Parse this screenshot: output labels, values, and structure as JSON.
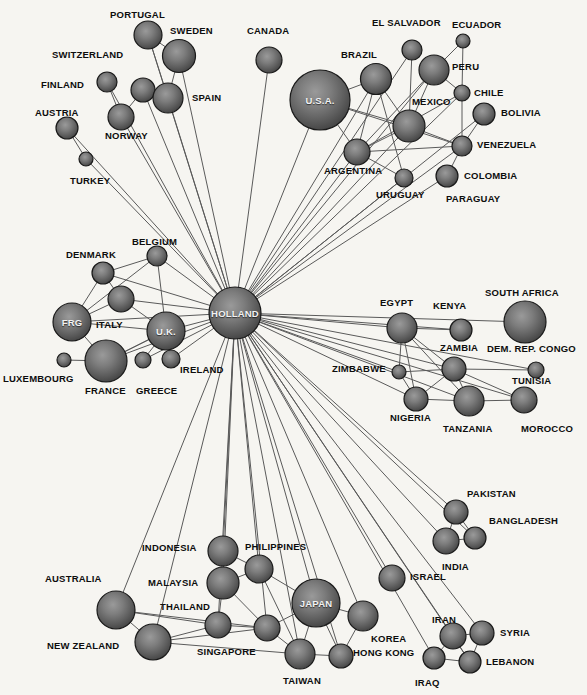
{
  "diagram": {
    "title": "HOLLAND",
    "background_color": "#f6f5f1",
    "edge_color": "#5a5a5a",
    "node_fill_center": "#8d8d8d",
    "node_fill_edge": "#4b4b4b",
    "node_stroke": "#1a1a1a",
    "label_color": "#0d0d0d",
    "inner_label_color": "#f2f2f2"
  },
  "chart_data": {
    "type": "network",
    "title": "HOLLAND",
    "hub": "HOLLAND",
    "node_count": 71,
    "nodes": [
      {
        "id": "PORTUGAL",
        "label": "PORTUGAL",
        "x": 148,
        "y": 35,
        "r": 14,
        "label_x": 110,
        "label_y": 10,
        "inside": false
      },
      {
        "id": "SWEDEN",
        "label": "SWEDEN",
        "x": 179,
        "y": 56,
        "r": 16.5,
        "label_x": 170,
        "label_y": 26,
        "inside": false
      },
      {
        "id": "CANADA",
        "label": "CANADA",
        "x": 269,
        "y": 60,
        "r": 13,
        "label_x": 247,
        "label_y": 26,
        "inside": false
      },
      {
        "id": "EL SALVADOR",
        "label": "EL SALVADOR",
        "x": 412,
        "y": 50,
        "r": 10,
        "label_x": 372,
        "label_y": 18,
        "inside": false
      },
      {
        "id": "ECUADOR",
        "label": "ECUADOR",
        "x": 463,
        "y": 41,
        "r": 7,
        "label_x": 452,
        "label_y": 20,
        "inside": false
      },
      {
        "id": "SWITZERLAND",
        "label": "SWITZERLAND",
        "x": 143,
        "y": 90,
        "r": 12,
        "label_x": 52,
        "label_y": 50,
        "inside": false
      },
      {
        "id": "BRAZIL",
        "label": "BRAZIL",
        "x": 376,
        "y": 79,
        "r": 15.5,
        "label_x": 341,
        "label_y": 50,
        "inside": false
      },
      {
        "id": "PERU",
        "label": "PERU",
        "x": 434,
        "y": 70,
        "r": 15,
        "label_x": 452,
        "label_y": 62,
        "inside": false
      },
      {
        "id": "FINLAND",
        "label": "FINLAND",
        "x": 107,
        "y": 82,
        "r": 10,
        "label_x": 41,
        "label_y": 80,
        "inside": false
      },
      {
        "id": "SPAIN",
        "label": "SPAIN",
        "x": 168,
        "y": 98,
        "r": 15,
        "label_x": 192,
        "label_y": 93,
        "inside": false
      },
      {
        "id": "U.S.A.",
        "label": "U.S.A.",
        "x": 320,
        "y": 100,
        "r": 30,
        "label_x": 0,
        "label_y": 0,
        "inside": true
      },
      {
        "id": "MEXICO",
        "label": "MEXICO",
        "x": 409,
        "y": 126,
        "r": 16,
        "label_x": 412,
        "label_y": 97,
        "inside": false
      },
      {
        "id": "CHILE",
        "label": "CHILE",
        "x": 462,
        "y": 93,
        "r": 8,
        "label_x": 474,
        "label_y": 88,
        "inside": false
      },
      {
        "id": "AUSTRIA",
        "label": "AUSTRIA",
        "x": 67,
        "y": 128,
        "r": 11,
        "label_x": 35,
        "label_y": 108,
        "inside": false
      },
      {
        "id": "NORWAY",
        "label": "NORWAY",
        "x": 121,
        "y": 117,
        "r": 13,
        "label_x": 105,
        "label_y": 131,
        "inside": false
      },
      {
        "id": "BOLIVIA",
        "label": "BOLIVIA",
        "x": 484,
        "y": 114,
        "r": 11,
        "label_x": 501,
        "label_y": 108,
        "inside": false
      },
      {
        "id": "VENEZUELA",
        "label": "VENEZUELA",
        "x": 462,
        "y": 146,
        "r": 10,
        "label_x": 477,
        "label_y": 140,
        "inside": false
      },
      {
        "id": "TURKEY",
        "label": "TURKEY",
        "x": 86,
        "y": 159,
        "r": 7,
        "label_x": 70,
        "label_y": 176,
        "inside": false
      },
      {
        "id": "ARGENTINA",
        "label": "ARGENTINA",
        "x": 357,
        "y": 152,
        "r": 13,
        "label_x": 324,
        "label_y": 166,
        "inside": false
      },
      {
        "id": "COLOMBIA",
        "label": "COLOMBIA",
        "x": 447,
        "y": 176,
        "r": 11,
        "label_x": 464,
        "label_y": 171,
        "inside": false
      },
      {
        "id": "URUGUAY",
        "label": "URUGUAY",
        "x": 404,
        "y": 178,
        "r": 9,
        "label_x": 376,
        "label_y": 190,
        "inside": false
      },
      {
        "id": "PARAGUAY",
        "label": "PARAGUAY",
        "x": 447,
        "y": 176,
        "r": 0,
        "label_x": 446,
        "label_y": 194,
        "inside": false
      },
      {
        "id": "DENMARK",
        "label": "DENMARK",
        "x": 103,
        "y": 273,
        "r": 11,
        "label_x": 66,
        "label_y": 250,
        "inside": false
      },
      {
        "id": "BELGIUM",
        "label": "BELGIUM",
        "x": 157,
        "y": 256,
        "r": 10,
        "label_x": 132,
        "label_y": 237,
        "inside": false
      },
      {
        "id": "SOUTH AFRICA",
        "label": "SOUTH AFRICA",
        "x": 525,
        "y": 322,
        "r": 21,
        "label_x": 485,
        "label_y": 288,
        "inside": false
      },
      {
        "id": "ITALY",
        "label": "ITALY",
        "x": 121,
        "y": 299,
        "r": 13,
        "label_x": 96,
        "label_y": 320,
        "inside": false
      },
      {
        "id": "EGYPT",
        "label": "EGYPT",
        "x": 402,
        "y": 328,
        "r": 15,
        "label_x": 380,
        "label_y": 298,
        "inside": false
      },
      {
        "id": "KENYA",
        "label": "KENYA",
        "x": 461,
        "y": 330,
        "r": 11,
        "label_x": 433,
        "label_y": 301,
        "inside": false
      },
      {
        "id": "FRG",
        "label": "FRG",
        "x": 72,
        "y": 322,
        "r": 19,
        "label_x": 0,
        "label_y": 0,
        "inside": true
      },
      {
        "id": "HOLLAND",
        "label": "HOLLAND",
        "x": 235,
        "y": 313,
        "r": 26,
        "label_x": 0,
        "label_y": 0,
        "inside": true
      },
      {
        "id": "U.K.",
        "label": "U.K.",
        "x": 166,
        "y": 331,
        "r": 19,
        "label_x": 0,
        "label_y": 0,
        "inside": true
      },
      {
        "id": "ZAMBIA",
        "label": "ZAMBIA",
        "x": 454,
        "y": 369,
        "r": 12,
        "label_x": 440,
        "label_y": 343,
        "inside": false
      },
      {
        "id": "DEM. REP. CONGO",
        "label": "DEM. REP. CONGO",
        "x": 536,
        "y": 370,
        "r": 8,
        "label_x": 487,
        "label_y": 344,
        "inside": false
      },
      {
        "id": "ZIMBABWE",
        "label": "ZIMBABWE",
        "x": 399,
        "y": 372,
        "r": 7,
        "label_x": 332,
        "label_y": 364,
        "inside": false
      },
      {
        "id": "LUXEMBOURG",
        "label": "LUXEMBOURG",
        "x": 64,
        "y": 360,
        "r": 7,
        "label_x": 3,
        "label_y": 374,
        "inside": false
      },
      {
        "id": "FRANCE",
        "label": "FRANCE",
        "x": 106,
        "y": 361,
        "r": 21,
        "label_x": 85,
        "label_y": 386,
        "inside": false
      },
      {
        "id": "GREECE",
        "label": "GREECE",
        "x": 143,
        "y": 360,
        "r": 8,
        "label_x": 136,
        "label_y": 386,
        "inside": false
      },
      {
        "id": "IRELAND",
        "label": "IRELAND",
        "x": 171,
        "y": 359,
        "r": 9,
        "label_x": 180,
        "label_y": 365,
        "inside": false
      },
      {
        "id": "TUNISIA",
        "label": "TUNISIA",
        "x": 524,
        "y": 400,
        "r": 13,
        "label_x": 512,
        "label_y": 376,
        "inside": false
      },
      {
        "id": "NIGERIA",
        "label": "NIGERIA",
        "x": 416,
        "y": 399,
        "r": 12,
        "label_x": 390,
        "label_y": 413,
        "inside": false
      },
      {
        "id": "TANZANIA",
        "label": "TANZANIA",
        "x": 469,
        "y": 401,
        "r": 15,
        "label_x": 443,
        "label_y": 424,
        "inside": false
      },
      {
        "id": "MOROCCO",
        "label": "MOROCCO",
        "x": 524,
        "y": 400,
        "r": 0,
        "label_x": 521,
        "label_y": 424,
        "inside": false
      },
      {
        "id": "PAKISTAN",
        "label": "PAKISTAN",
        "x": 456,
        "y": 512,
        "r": 12,
        "label_x": 467,
        "label_y": 489,
        "inside": false
      },
      {
        "id": "BANGLADESH",
        "label": "BANGLADESH",
        "x": 475,
        "y": 538,
        "r": 11,
        "label_x": 489,
        "label_y": 516,
        "inside": false
      },
      {
        "id": "INDONESIA",
        "label": "INDONESIA",
        "x": 223,
        "y": 551,
        "r": 15,
        "label_x": 142,
        "label_y": 543,
        "inside": false
      },
      {
        "id": "PHILIPPINES",
        "label": "PHILIPPINES",
        "x": 259,
        "y": 569,
        "r": 14,
        "label_x": 245,
        "label_y": 542,
        "inside": false
      },
      {
        "id": "INDIA",
        "label": "INDIA",
        "x": 446,
        "y": 541,
        "r": 13,
        "label_x": 442,
        "label_y": 562,
        "inside": false
      },
      {
        "id": "MALAYSIA",
        "label": "MALAYSIA",
        "x": 223,
        "y": 583,
        "r": 16,
        "label_x": 148,
        "label_y": 578,
        "inside": false
      },
      {
        "id": "AUSTRALIA",
        "label": "AUSTRALIA",
        "x": 116,
        "y": 610,
        "r": 19,
        "label_x": 45,
        "label_y": 574,
        "inside": false
      },
      {
        "id": "ISRAEL",
        "label": "ISRAEL",
        "x": 392,
        "y": 578,
        "r": 13,
        "label_x": 410,
        "label_y": 572,
        "inside": false
      },
      {
        "id": "JAPAN",
        "label": "JAPAN",
        "x": 316,
        "y": 603,
        "r": 24,
        "label_x": 0,
        "label_y": 0,
        "inside": true
      },
      {
        "id": "THAILAND",
        "label": "THAILAND",
        "x": 218,
        "y": 625,
        "r": 13,
        "label_x": 160,
        "label_y": 602,
        "inside": false
      },
      {
        "id": "KOREA",
        "label": "KOREA",
        "x": 363,
        "y": 616,
        "r": 15,
        "label_x": 371,
        "label_y": 634,
        "inside": false
      },
      {
        "id": "IRAN",
        "label": "IRAN",
        "x": 453,
        "y": 636,
        "r": 13,
        "label_x": 432,
        "label_y": 615,
        "inside": false
      },
      {
        "id": "SYRIA",
        "label": "SYRIA",
        "x": 482,
        "y": 633,
        "r": 12,
        "label_x": 500,
        "label_y": 628,
        "inside": false
      },
      {
        "id": "NEW ZEALAND",
        "label": "NEW ZEALAND",
        "x": 153,
        "y": 642,
        "r": 18,
        "label_x": 47,
        "label_y": 641,
        "inside": false
      },
      {
        "id": "SINGAPORE",
        "label": "SINGAPORE",
        "x": 267,
        "y": 628,
        "r": 13,
        "label_x": 197,
        "label_y": 647,
        "inside": false
      },
      {
        "id": "HONG KONG",
        "label": "HONG KONG",
        "x": 341,
        "y": 656,
        "r": 12,
        "label_x": 353,
        "label_y": 648,
        "inside": false
      },
      {
        "id": "TAIWAN",
        "label": "TAIWAN",
        "x": 300,
        "y": 654,
        "r": 15,
        "label_x": 283,
        "label_y": 676,
        "inside": false
      },
      {
        "id": "IRAQ",
        "label": "IRAQ",
        "x": 434,
        "y": 658,
        "r": 11,
        "label_x": 415,
        "label_y": 678,
        "inside": false
      },
      {
        "id": "LEBANON",
        "label": "LEBANON",
        "x": 470,
        "y": 662,
        "r": 11,
        "label_x": 486,
        "label_y": 657,
        "inside": false
      }
    ],
    "edges": [
      [
        "HOLLAND",
        "PORTUGAL"
      ],
      [
        "HOLLAND",
        "SWEDEN"
      ],
      [
        "HOLLAND",
        "CANADA"
      ],
      [
        "HOLLAND",
        "SWITZERLAND"
      ],
      [
        "HOLLAND",
        "SPAIN"
      ],
      [
        "HOLLAND",
        "NORWAY"
      ],
      [
        "HOLLAND",
        "FINLAND"
      ],
      [
        "HOLLAND",
        "AUSTRIA"
      ],
      [
        "HOLLAND",
        "TURKEY"
      ],
      [
        "HOLLAND",
        "U.S.A."
      ],
      [
        "HOLLAND",
        "BRAZIL"
      ],
      [
        "HOLLAND",
        "MEXICO"
      ],
      [
        "HOLLAND",
        "PERU"
      ],
      [
        "HOLLAND",
        "ARGENTINA"
      ],
      [
        "HOLLAND",
        "VENEZUELA"
      ],
      [
        "HOLLAND",
        "COLOMBIA"
      ],
      [
        "HOLLAND",
        "BOLIVIA"
      ],
      [
        "HOLLAND",
        "URUGUAY"
      ],
      [
        "HOLLAND",
        "EL SALVADOR"
      ],
      [
        "HOLLAND",
        "CHILE"
      ],
      [
        "HOLLAND",
        "DENMARK"
      ],
      [
        "HOLLAND",
        "BELGIUM"
      ],
      [
        "HOLLAND",
        "ITALY"
      ],
      [
        "HOLLAND",
        "FRG"
      ],
      [
        "HOLLAND",
        "U.K."
      ],
      [
        "HOLLAND",
        "FRANCE"
      ],
      [
        "HOLLAND",
        "GREECE"
      ],
      [
        "HOLLAND",
        "IRELAND"
      ],
      [
        "HOLLAND",
        "EGYPT"
      ],
      [
        "HOLLAND",
        "KENYA"
      ],
      [
        "HOLLAND",
        "SOUTH AFRICA"
      ],
      [
        "HOLLAND",
        "ZAMBIA"
      ],
      [
        "HOLLAND",
        "ZIMBABWE"
      ],
      [
        "HOLLAND",
        "NIGERIA"
      ],
      [
        "HOLLAND",
        "TANZANIA"
      ],
      [
        "HOLLAND",
        "TUNISIA"
      ],
      [
        "HOLLAND",
        "DEM. REP. CONGO"
      ],
      [
        "HOLLAND",
        "PAKISTAN"
      ],
      [
        "HOLLAND",
        "BANGLADESH"
      ],
      [
        "HOLLAND",
        "INDIA"
      ],
      [
        "HOLLAND",
        "ISRAEL"
      ],
      [
        "HOLLAND",
        "IRAN"
      ],
      [
        "HOLLAND",
        "SYRIA"
      ],
      [
        "HOLLAND",
        "IRAQ"
      ],
      [
        "HOLLAND",
        "LEBANON"
      ],
      [
        "HOLLAND",
        "JAPAN"
      ],
      [
        "HOLLAND",
        "KOREA"
      ],
      [
        "HOLLAND",
        "TAIWAN"
      ],
      [
        "HOLLAND",
        "HONG KONG"
      ],
      [
        "HOLLAND",
        "SINGAPORE"
      ],
      [
        "HOLLAND",
        "THAILAND"
      ],
      [
        "HOLLAND",
        "MALAYSIA"
      ],
      [
        "HOLLAND",
        "INDONESIA"
      ],
      [
        "HOLLAND",
        "PHILIPPINES"
      ],
      [
        "HOLLAND",
        "AUSTRALIA"
      ],
      [
        "HOLLAND",
        "NEW ZEALAND"
      ],
      [
        "PORTUGAL",
        "SWEDEN"
      ],
      [
        "PORTUGAL",
        "SPAIN"
      ],
      [
        "SWEDEN",
        "SPAIN"
      ],
      [
        "SWITZERLAND",
        "SPAIN"
      ],
      [
        "SWITZERLAND",
        "NORWAY"
      ],
      [
        "FINLAND",
        "NORWAY"
      ],
      [
        "AUSTRIA",
        "TURKEY"
      ],
      [
        "U.S.A.",
        "BRAZIL"
      ],
      [
        "U.S.A.",
        "ARGENTINA"
      ],
      [
        "U.S.A.",
        "MEXICO"
      ],
      [
        "U.S.A.",
        "VENEZUELA"
      ],
      [
        "BRAZIL",
        "ARGENTINA"
      ],
      [
        "BRAZIL",
        "MEXICO"
      ],
      [
        "BRAZIL",
        "URUGUAY"
      ],
      [
        "EL SALVADOR",
        "MEXICO"
      ],
      [
        "ECUADOR",
        "PERU"
      ],
      [
        "ECUADOR",
        "CHILE"
      ],
      [
        "PERU",
        "CHILE"
      ],
      [
        "PERU",
        "MEXICO"
      ],
      [
        "PERU",
        "ARGENTINA"
      ],
      [
        "MEXICO",
        "ARGENTINA"
      ],
      [
        "MEXICO",
        "VENEZUELA"
      ],
      [
        "CHILE",
        "VENEZUELA"
      ],
      [
        "BOLIVIA",
        "VENEZUELA"
      ],
      [
        "VENEZUELA",
        "ARGENTINA"
      ],
      [
        "VENEZUELA",
        "COLOMBIA"
      ],
      [
        "ARGENTINA",
        "URUGUAY"
      ],
      [
        "ARGENTINA",
        "CHILE"
      ],
      [
        "DENMARK",
        "BELGIUM"
      ],
      [
        "DENMARK",
        "ITALY"
      ],
      [
        "DENMARK",
        "FRG"
      ],
      [
        "BELGIUM",
        "U.K."
      ],
      [
        "BELGIUM",
        "FRG"
      ],
      [
        "ITALY",
        "FRG"
      ],
      [
        "ITALY",
        "U.K."
      ],
      [
        "FRG",
        "FRANCE"
      ],
      [
        "FRG",
        "U.K."
      ],
      [
        "FRANCE",
        "LUXEMBOURG"
      ],
      [
        "FRANCE",
        "U.K."
      ],
      [
        "U.K.",
        "GREECE"
      ],
      [
        "U.K.",
        "IRELAND"
      ],
      [
        "U.K.",
        "FRANCE"
      ],
      [
        "EGYPT",
        "KENYA"
      ],
      [
        "EGYPT",
        "ZAMBIA"
      ],
      [
        "EGYPT",
        "ZIMBABWE"
      ],
      [
        "EGYPT",
        "NIGERIA"
      ],
      [
        "EGYPT",
        "TANZANIA"
      ],
      [
        "ZAMBIA",
        "DEM. REP. CONGO"
      ],
      [
        "ZAMBIA",
        "TANZANIA"
      ],
      [
        "ZAMBIA",
        "NIGERIA"
      ],
      [
        "ZAMBIA",
        "ZIMBABWE"
      ],
      [
        "ZIMBABWE",
        "NIGERIA"
      ],
      [
        "NIGERIA",
        "TANZANIA"
      ],
      [
        "TANZANIA",
        "TUNISIA"
      ],
      [
        "ZAMBIA",
        "TUNISIA"
      ],
      [
        "AUSTRALIA",
        "NEW ZEALAND"
      ],
      [
        "AUSTRALIA",
        "THAILAND"
      ],
      [
        "AUSTRALIA",
        "SINGAPORE"
      ],
      [
        "NEW ZEALAND",
        "THAILAND"
      ],
      [
        "NEW ZEALAND",
        "SINGAPORE"
      ],
      [
        "NEW ZEALAND",
        "TAIWAN"
      ],
      [
        "INDONESIA",
        "MALAYSIA"
      ],
      [
        "INDONESIA",
        "PHILIPPINES"
      ],
      [
        "MALAYSIA",
        "THAILAND"
      ],
      [
        "MALAYSIA",
        "PHILIPPINES"
      ],
      [
        "MALAYSIA",
        "SINGAPORE"
      ],
      [
        "THAILAND",
        "SINGAPORE"
      ],
      [
        "SINGAPORE",
        "JAPAN"
      ],
      [
        "SINGAPORE",
        "TAIWAN"
      ],
      [
        "PHILIPPINES",
        "JAPAN"
      ],
      [
        "PHILIPPINES",
        "TAIWAN"
      ],
      [
        "JAPAN",
        "KOREA"
      ],
      [
        "JAPAN",
        "TAIWAN"
      ],
      [
        "JAPAN",
        "HONG KONG"
      ],
      [
        "KOREA",
        "HONG KONG"
      ],
      [
        "TAIWAN",
        "HONG KONG"
      ],
      [
        "PAKISTAN",
        "BANGLADESH"
      ],
      [
        "PAKISTAN",
        "INDIA"
      ],
      [
        "INDIA",
        "BANGLADESH"
      ],
      [
        "IRAN",
        "SYRIA"
      ],
      [
        "IRAN",
        "IRAQ"
      ],
      [
        "IRAN",
        "LEBANON"
      ],
      [
        "SYRIA",
        "LEBANON"
      ],
      [
        "IRAQ",
        "LEBANON"
      ]
    ]
  }
}
